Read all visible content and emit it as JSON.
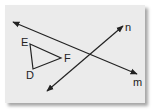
{
  "diagram": {
    "type": "geometry",
    "lines": [
      {
        "name": "m",
        "label": "m",
        "from": [
          13,
          22
        ],
        "to": [
          137,
          74
        ],
        "arrows": "both"
      },
      {
        "name": "n",
        "label": "n",
        "from": [
          47,
          91
        ],
        "to": [
          123,
          26
        ],
        "arrows": "both"
      }
    ],
    "triangle": {
      "vertices": {
        "E": {
          "label": "E",
          "point": [
            30,
            44
          ]
        },
        "F": {
          "label": "F",
          "point": [
            61,
            58
          ]
        },
        "D": {
          "label": "D",
          "point": [
            33,
            69
          ]
        }
      }
    },
    "colors": {
      "stroke": "#222222",
      "background": "#ebebeb"
    }
  }
}
